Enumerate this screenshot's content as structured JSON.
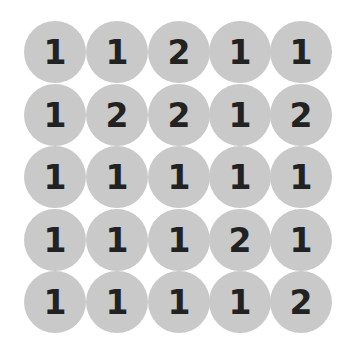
{
  "board": {
    "rows": 5,
    "cols": 5,
    "tile_color": "#c9c9c9",
    "text_color": "#222222",
    "cells": [
      [
        "1",
        "1",
        "2",
        "1",
        "1"
      ],
      [
        "1",
        "2",
        "2",
        "1",
        "2"
      ],
      [
        "1",
        "1",
        "1",
        "1",
        "1"
      ],
      [
        "1",
        "1",
        "1",
        "2",
        "1"
      ],
      [
        "1",
        "1",
        "1",
        "1",
        "2"
      ]
    ]
  }
}
